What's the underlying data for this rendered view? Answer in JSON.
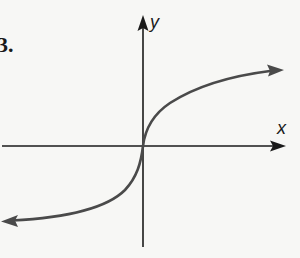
{
  "figure": {
    "problem_number": "3.",
    "x_axis_label": "x",
    "y_axis_label": "y",
    "colors": {
      "background": "#f7f7f5",
      "axes": "#1a1a1a",
      "curve": "#4a4a4a"
    }
  }
}
